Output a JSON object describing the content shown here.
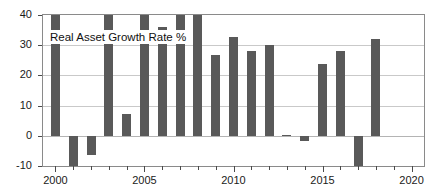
{
  "chart_data": {
    "type": "bar",
    "title": "Real Asset Growth Rate %",
    "xlabel": "",
    "ylabel": "",
    "xlim": [
      1999.3,
      2020.7
    ],
    "ylim": [
      -10,
      40
    ],
    "yticks": [
      -10,
      0,
      10,
      20,
      30,
      40
    ],
    "ytick_labels": [
      "-10",
      "0",
      "10",
      "20",
      "30",
      "40"
    ],
    "xticks_major": [
      2000,
      2005,
      2010,
      2015,
      2020
    ],
    "xtick_major_labels": [
      "2000",
      "2005",
      "2010",
      "2015",
      "2020"
    ],
    "xticks_minor": [
      2001,
      2002,
      2003,
      2004,
      2006,
      2007,
      2008,
      2009,
      2011,
      2012,
      2013,
      2014,
      2016,
      2017,
      2018,
      2019
    ],
    "grid": true,
    "grid_axis": "y",
    "legend": null,
    "bar_color": "#595959",
    "categories": [
      2000,
      2001,
      2002,
      2003,
      2004,
      2005,
      2006,
      2007,
      2008,
      2009,
      2010,
      2011,
      2012,
      2013,
      2014,
      2015,
      2016,
      2017,
      2018,
      2019,
      2020
    ],
    "values": [
      44,
      -10.0,
      -6.5,
      45,
      7.2,
      46,
      36.0,
      43,
      42,
      26.8,
      32.6,
      28.2,
      30.2,
      0.2,
      -1.6,
      23.9,
      28.2,
      -10.0,
      32.2,
      0,
      0
    ],
    "clipped_top": [
      2000,
      2003,
      2005,
      2007,
      2008
    ],
    "clipped_bottom": [
      2001,
      2017
    ]
  },
  "figure": {
    "background_color": "#ffffff",
    "frame_color": "#8a8a8a",
    "gridline_color": "#c9c9c9",
    "tick_color": "#4a4a4a",
    "text_color": "#1a1a1a"
  }
}
